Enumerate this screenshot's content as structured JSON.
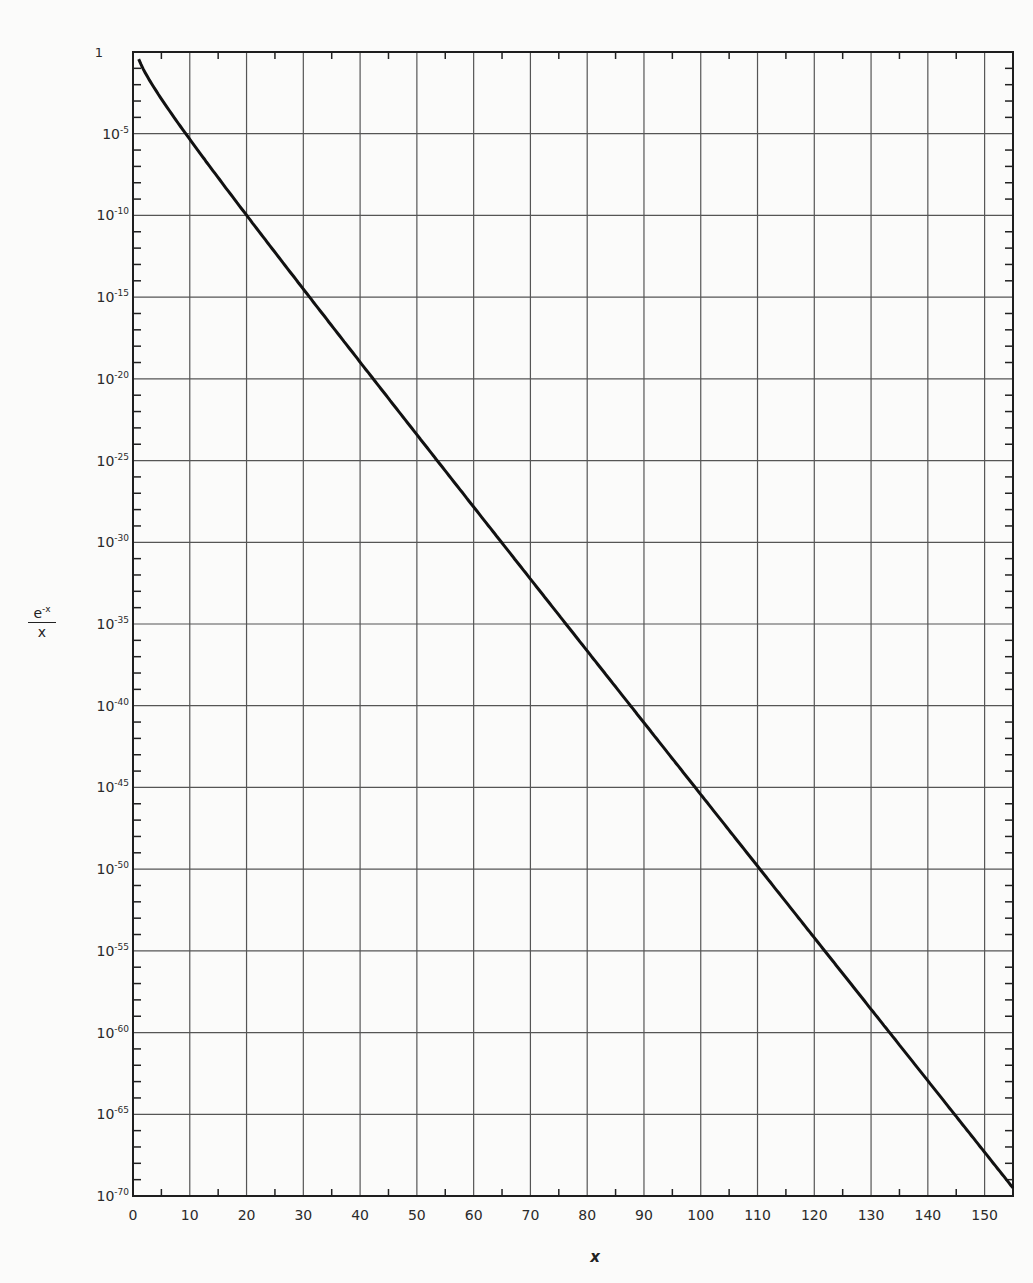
{
  "chart_data": {
    "type": "line",
    "title": "",
    "xlabel": "x",
    "ylabel": "e^-x / x",
    "yscale": "log",
    "xlim": [
      0,
      155
    ],
    "ylim": [
      1e-70,
      1
    ],
    "grid": true,
    "legend": null,
    "x_ticks": [
      0,
      10,
      20,
      30,
      40,
      50,
      60,
      70,
      80,
      90,
      100,
      110,
      120,
      130,
      140,
      150
    ],
    "y_ticks": [
      "1",
      "10^-5",
      "10^-10",
      "10^-15",
      "10^-20",
      "10^-25",
      "10^-30",
      "10^-35",
      "10^-40",
      "10^-45",
      "10^-50",
      "10^-55",
      "10^-60",
      "10^-65",
      "10^-70"
    ],
    "series": [
      {
        "name": "e^-x / x",
        "x": [
          1,
          2,
          5,
          10,
          20,
          30,
          40,
          50,
          60,
          70,
          80,
          90,
          100,
          110,
          120,
          130,
          140,
          150,
          155
        ],
        "values": [
          0.368,
          0.0677,
          0.00135,
          4.54e-06,
          1.03e-10,
          3.12e-15,
          1.06e-19,
          3.86e-24,
          1.46e-28,
          5.67e-33,
          2.26e-37,
          9.13e-42,
          3.72e-46,
          1.53e-50,
          6.34e-55,
          2.64e-59,
          1.1e-63,
          4.62e-68,
          3.09e-70
        ]
      }
    ]
  },
  "y_axis": {
    "labels": [
      {
        "base": "1",
        "exp": ""
      },
      {
        "base": "10",
        "exp": "-5"
      },
      {
        "base": "10",
        "exp": "-10"
      },
      {
        "base": "10",
        "exp": "-15"
      },
      {
        "base": "10",
        "exp": "-20"
      },
      {
        "base": "10",
        "exp": "-25"
      },
      {
        "base": "10",
        "exp": "-30"
      },
      {
        "base": "10",
        "exp": "-35"
      },
      {
        "base": "10",
        "exp": "-40"
      },
      {
        "base": "10",
        "exp": "-45"
      },
      {
        "base": "10",
        "exp": "-50"
      },
      {
        "base": "10",
        "exp": "-55"
      },
      {
        "base": "10",
        "exp": "-60"
      },
      {
        "base": "10",
        "exp": "-65"
      },
      {
        "base": "10",
        "exp": "-70"
      }
    ],
    "title_numerator": "e",
    "title_numerator_exp": "-x",
    "title_denominator": "x"
  },
  "x_axis": {
    "labels": [
      "0",
      "10",
      "20",
      "30",
      "40",
      "50",
      "60",
      "70",
      "80",
      "90",
      "100",
      "110",
      "120",
      "130",
      "140",
      "150"
    ],
    "title": "x"
  }
}
